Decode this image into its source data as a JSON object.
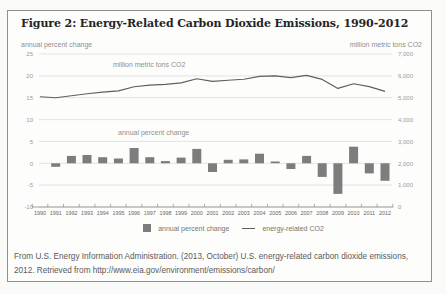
{
  "figure": {
    "title": "Figure 2: Energy-Related Carbon Dioxide Emissions, 1990-2012",
    "left_axis_title": "annual percent change",
    "right_axis_title": "million metric tons CO2"
  },
  "legend": {
    "bar_label": "annual percent change",
    "line_label": "energy-related CO2"
  },
  "caption": {
    "lines": [
      "From U.S. Energy Information Administration. (2013, October) U.S. energy-related carbon dioxide emissions,",
      "2012. Retrieved from http://www.eia.gov/environment/emissions/carbon/"
    ]
  },
  "chart_data": {
    "type": "combo-bar-line",
    "title": "Figure 2: Energy-Related Carbon Dioxide Emissions, 1990-2012",
    "categories": [
      1990,
      1991,
      1992,
      1993,
      1994,
      1995,
      1996,
      1997,
      1998,
      1999,
      2000,
      2001,
      2002,
      2003,
      2004,
      2005,
      2006,
      2007,
      2008,
      2009,
      2010,
      2011,
      2012
    ],
    "series": [
      {
        "name": "annual percent change",
        "type": "bar",
        "axis": "left",
        "color": "#7d7d7d",
        "values": [
          null,
          -0.8,
          1.7,
          1.9,
          1.4,
          1.1,
          3.5,
          1.4,
          0.5,
          1.3,
          3.3,
          -2.0,
          0.8,
          0.9,
          2.2,
          0.4,
          -1.3,
          1.7,
          -3.1,
          -7.0,
          3.8,
          -2.3,
          -4.0
        ]
      },
      {
        "name": "energy-related CO2",
        "type": "line",
        "axis": "right",
        "color": "#5f5f5f",
        "values": [
          5040,
          5000,
          5086,
          5184,
          5257,
          5314,
          5501,
          5577,
          5607,
          5680,
          5866,
          5748,
          5795,
          5846,
          5974,
          5999,
          5920,
          6023,
          5839,
          5428,
          5636,
          5508,
          5290
        ]
      }
    ],
    "left_axis": {
      "label": "annual percent change",
      "ticks": [
        25,
        20,
        15,
        10,
        5,
        0,
        -5,
        -10
      ],
      "range": [
        -10,
        25
      ]
    },
    "right_axis": {
      "label": "million metric tons CO2",
      "tick_labels": [
        "7,000",
        "6,000",
        "5,000",
        "4,000",
        "3,000",
        "2,000",
        "1,000",
        "0"
      ],
      "range": [
        0,
        7000
      ]
    },
    "inner_labels": {
      "line": "million metric tons CO2",
      "bars": "annual percent change"
    },
    "grid_color": "#d9d9d9",
    "grid": true,
    "legend_position": "bottom"
  }
}
